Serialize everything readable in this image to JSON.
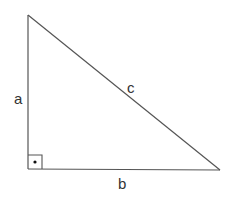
{
  "diagram": {
    "type": "right-triangle",
    "stroke_color": "#555555",
    "label_color": "#333333",
    "vertices": {
      "top": [
        28,
        15
      ],
      "right_angle": [
        28,
        169
      ],
      "right": [
        220,
        170
      ]
    },
    "sides": {
      "vertical": {
        "label": "a"
      },
      "horizontal": {
        "label": "b"
      },
      "hypotenuse": {
        "label": "c"
      }
    },
    "right_angle_marker": {
      "shape": "square-with-dot",
      "size": 14
    }
  }
}
